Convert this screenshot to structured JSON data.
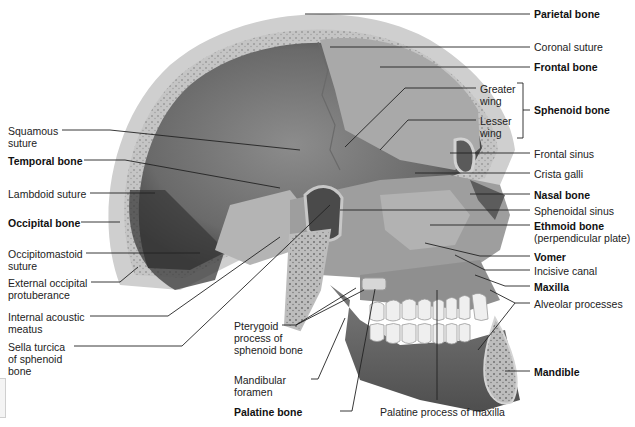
{
  "figure": {
    "colors": {
      "bone_outer": "#c9c9c9",
      "bone_inner": "#8a8a8a",
      "cavity": "#5e5e5e",
      "spongy": "#a6a6a6",
      "teeth": "#ededed",
      "leader": "#222222"
    }
  },
  "labels_left": [
    {
      "id": "squamous-suture",
      "text": [
        "Squamous",
        "suture"
      ],
      "bold": false
    },
    {
      "id": "temporal-bone",
      "text": [
        "Temporal bone"
      ],
      "bold": true
    },
    {
      "id": "lambdoid-suture",
      "text": [
        "Lambdoid suture"
      ],
      "bold": false
    },
    {
      "id": "occipital-bone",
      "text": [
        "Occipital bone"
      ],
      "bold": true
    },
    {
      "id": "occipitomastoid-suture",
      "text": [
        "Occipitomastoid",
        "suture"
      ],
      "bold": false
    },
    {
      "id": "external-occipital-protuberance",
      "text": [
        "External occipital",
        "protuberance"
      ],
      "bold": false
    },
    {
      "id": "internal-acoustic-meatus",
      "text": [
        "Internal acoustic",
        "meatus"
      ],
      "bold": false
    },
    {
      "id": "sella-turcica",
      "text": [
        "Sella turcica",
        "of sphenoid",
        "bone"
      ],
      "bold": false
    }
  ],
  "labels_bottom": [
    {
      "id": "pterygoid-process",
      "text": [
        "Pterygoid",
        "process of",
        "sphenoid bone"
      ],
      "bold": false
    },
    {
      "id": "mandibular-foramen",
      "text": [
        "Mandibular",
        "foramen"
      ],
      "bold": false
    },
    {
      "id": "palatine-bone",
      "text": [
        "Palatine bone"
      ],
      "bold": true
    },
    {
      "id": "palatine-process-of-maxilla",
      "text": [
        "Palatine process of maxilla"
      ],
      "bold": false
    }
  ],
  "labels_right": [
    {
      "id": "parietal-bone",
      "text": [
        "Parietal bone"
      ],
      "bold": true
    },
    {
      "id": "coronal-suture",
      "text": [
        "Coronal suture"
      ],
      "bold": false
    },
    {
      "id": "frontal-bone",
      "text": [
        "Frontal bone"
      ],
      "bold": true
    },
    {
      "id": "greater-wing",
      "text": [
        "Greater",
        "wing"
      ],
      "bold": false
    },
    {
      "id": "lesser-wing",
      "text": [
        "Lesser",
        "wing"
      ],
      "bold": false
    },
    {
      "id": "sphenoid-bone",
      "text": [
        "Sphenoid bone"
      ],
      "bold": true
    },
    {
      "id": "frontal-sinus",
      "text": [
        "Frontal sinus"
      ],
      "bold": false
    },
    {
      "id": "crista-galli",
      "text": [
        "Crista galli"
      ],
      "bold": false
    },
    {
      "id": "nasal-bone",
      "text": [
        "Nasal bone"
      ],
      "bold": true
    },
    {
      "id": "sphenoidal-sinus",
      "text": [
        "Sphenoidal sinus"
      ],
      "bold": false
    },
    {
      "id": "ethmoid-bone",
      "text": [
        "Ethmoid bone"
      ],
      "bold": true
    },
    {
      "id": "ethmoid-subtitle",
      "text": [
        "(perpendicular plate)"
      ],
      "bold": false
    },
    {
      "id": "vomer",
      "text": [
        "Vomer"
      ],
      "bold": true
    },
    {
      "id": "incisive-canal",
      "text": [
        "Incisive canal"
      ],
      "bold": false
    },
    {
      "id": "maxilla",
      "text": [
        "Maxilla"
      ],
      "bold": true
    },
    {
      "id": "alveolar-processes",
      "text": [
        "Alveolar processes"
      ],
      "bold": false
    },
    {
      "id": "mandible",
      "text": [
        "Mandible"
      ],
      "bold": true
    }
  ]
}
